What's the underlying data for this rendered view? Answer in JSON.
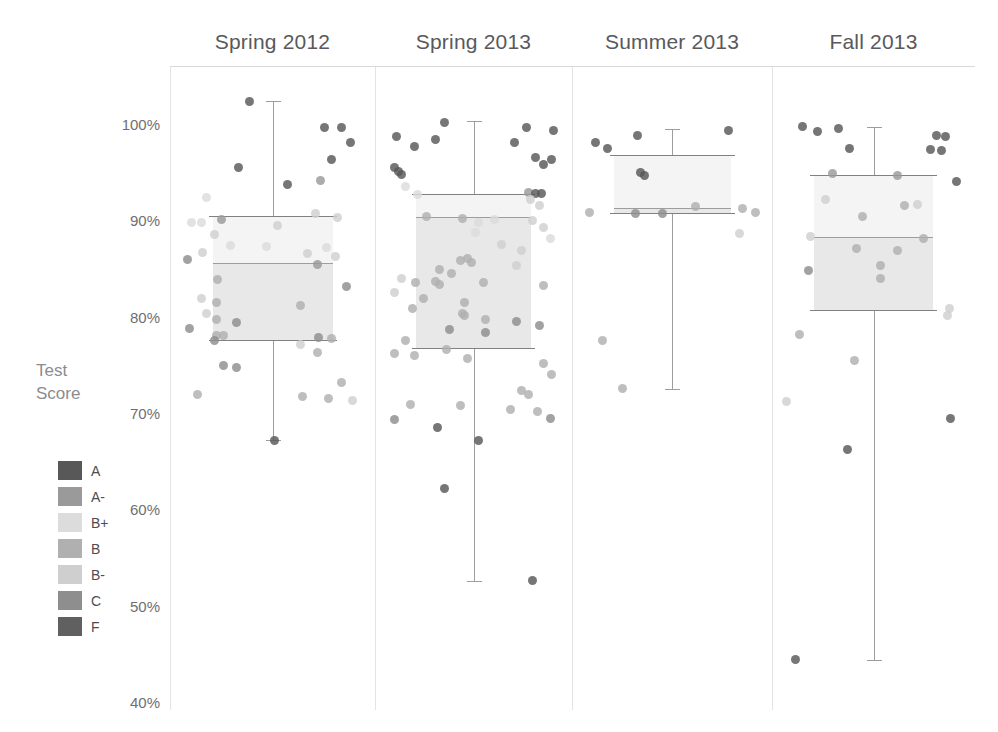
{
  "legend": {
    "title_line1": "Test",
    "title_line2": "Score",
    "items": [
      {
        "label": "A",
        "color": "#585858"
      },
      {
        "label": "A-",
        "color": "#9a9a9a"
      },
      {
        "label": "B+",
        "color": "#dcdcdc"
      },
      {
        "label": "B",
        "color": "#b0b0b0"
      },
      {
        "label": "B-",
        "color": "#cfcfcf"
      },
      {
        "label": "C",
        "color": "#8e8e8e"
      },
      {
        "label": "F",
        "color": "#606060"
      }
    ]
  },
  "chart_data": {
    "type": "box",
    "title": "",
    "xlabel": "",
    "ylabel": "Test Score",
    "ylim": [
      40,
      100
    ],
    "ytick_values": [
      100,
      90,
      80,
      70,
      60,
      50,
      40
    ],
    "ytick_labels": [
      "100%",
      "90%",
      "80%",
      "70%",
      "60%",
      "50%",
      "40%"
    ],
    "grid": false,
    "legend_position": "left",
    "categories": [
      "Spring 2012",
      "Spring 2013",
      "Summer 2013",
      "Fall 2013"
    ],
    "boxes": [
      {
        "category": "Spring 2012",
        "whisker_low": 67.3,
        "q1": 77.7,
        "median": 85.7,
        "q3": 90.6,
        "whisker_high": 102.5
      },
      {
        "category": "Spring 2013",
        "whisker_low": 52.7,
        "q1": 76.8,
        "median": 90.4,
        "q3": 92.8,
        "whisker_high": 100.4
      },
      {
        "category": "Summer 2013",
        "whisker_low": 72.6,
        "q1": 90.9,
        "median": 91.4,
        "q3": 96.9,
        "whisker_high": 99.6
      },
      {
        "category": "Fall 2013",
        "whisker_low": 44.5,
        "q1": 80.8,
        "median": 88.4,
        "q3": 94.8,
        "whisker_high": 99.8
      }
    ],
    "series": [
      {
        "name": "Spring 2012",
        "points": [
          {
            "v": 102.4,
            "j": 0.37,
            "g": "A"
          },
          {
            "v": 99.7,
            "j": 0.77,
            "g": "A"
          },
          {
            "v": 99.7,
            "j": 0.86,
            "g": "A"
          },
          {
            "v": 98.2,
            "j": 0.91,
            "g": "A"
          },
          {
            "v": 95.6,
            "j": 0.31,
            "g": "A"
          },
          {
            "v": 96.4,
            "j": 0.81,
            "g": "A"
          },
          {
            "v": 93.8,
            "j": 0.57,
            "g": "A"
          },
          {
            "v": 94.2,
            "j": 0.75,
            "g": "A-"
          },
          {
            "v": 92.5,
            "j": 0.14,
            "g": "B+"
          },
          {
            "v": 90.8,
            "j": 0.72,
            "g": "B-"
          },
          {
            "v": 90.4,
            "j": 0.84,
            "g": "B-"
          },
          {
            "v": 90.2,
            "j": 0.22,
            "g": "A-"
          },
          {
            "v": 89.9,
            "j": 0.06,
            "g": "B+"
          },
          {
            "v": 89.9,
            "j": 0.11,
            "g": "B+"
          },
          {
            "v": 89.6,
            "j": 0.52,
            "g": "B-"
          },
          {
            "v": 88.6,
            "j": 0.18,
            "g": "B-"
          },
          {
            "v": 87.5,
            "j": 0.27,
            "g": "B+"
          },
          {
            "v": 87.4,
            "j": 0.46,
            "g": "B+"
          },
          {
            "v": 87.3,
            "j": 0.78,
            "g": "B+"
          },
          {
            "v": 86.8,
            "j": 0.12,
            "g": "B-"
          },
          {
            "v": 86.7,
            "j": 0.68,
            "g": "B-"
          },
          {
            "v": 86.4,
            "j": 0.83,
            "g": "B-"
          },
          {
            "v": 86.0,
            "j": 0.04,
            "g": "C"
          },
          {
            "v": 85.5,
            "j": 0.73,
            "g": "A-"
          },
          {
            "v": 84.0,
            "j": 0.2,
            "g": "B"
          },
          {
            "v": 83.2,
            "j": 0.89,
            "g": "C"
          },
          {
            "v": 82.0,
            "j": 0.11,
            "g": "B-"
          },
          {
            "v": 81.6,
            "j": 0.19,
            "g": "B"
          },
          {
            "v": 81.3,
            "j": 0.64,
            "g": "B"
          },
          {
            "v": 80.4,
            "j": 0.14,
            "g": "B-"
          },
          {
            "v": 79.8,
            "j": 0.19,
            "g": "B"
          },
          {
            "v": 79.5,
            "j": 0.3,
            "g": "C"
          },
          {
            "v": 78.9,
            "j": 0.05,
            "g": "C"
          },
          {
            "v": 78.2,
            "j": 0.19,
            "g": "B"
          },
          {
            "v": 78.1,
            "j": 0.23,
            "g": "B"
          },
          {
            "v": 77.9,
            "j": 0.74,
            "g": "C"
          },
          {
            "v": 77.8,
            "j": 0.81,
            "g": "B"
          },
          {
            "v": 77.6,
            "j": 0.18,
            "g": "C"
          },
          {
            "v": 77.2,
            "j": 0.64,
            "g": "B-"
          },
          {
            "v": 76.4,
            "j": 0.73,
            "g": "B"
          },
          {
            "v": 75.0,
            "j": 0.23,
            "g": "C"
          },
          {
            "v": 74.8,
            "j": 0.3,
            "g": "C"
          },
          {
            "v": 73.3,
            "j": 0.86,
            "g": "B"
          },
          {
            "v": 72.0,
            "j": 0.09,
            "g": "B"
          },
          {
            "v": 71.8,
            "j": 0.65,
            "g": "B"
          },
          {
            "v": 71.6,
            "j": 0.79,
            "g": "B"
          },
          {
            "v": 71.4,
            "j": 0.92,
            "g": "B-"
          },
          {
            "v": 67.3,
            "j": 0.5,
            "g": "A"
          }
        ]
      },
      {
        "name": "Spring 2013",
        "points": [
          {
            "v": 100.3,
            "j": 0.33,
            "g": "A"
          },
          {
            "v": 99.7,
            "j": 0.79,
            "g": "A"
          },
          {
            "v": 99.4,
            "j": 0.94,
            "g": "A"
          },
          {
            "v": 98.8,
            "j": 0.06,
            "g": "A"
          },
          {
            "v": 98.5,
            "j": 0.28,
            "g": "A"
          },
          {
            "v": 98.2,
            "j": 0.72,
            "g": "A"
          },
          {
            "v": 97.8,
            "j": 0.16,
            "g": "A"
          },
          {
            "v": 96.6,
            "j": 0.84,
            "g": "A"
          },
          {
            "v": 96.4,
            "j": 0.93,
            "g": "A"
          },
          {
            "v": 95.9,
            "j": 0.88,
            "g": "A"
          },
          {
            "v": 95.6,
            "j": 0.05,
            "g": "A"
          },
          {
            "v": 95.2,
            "j": 0.07,
            "g": "A"
          },
          {
            "v": 94.9,
            "j": 0.09,
            "g": "A"
          },
          {
            "v": 93.6,
            "j": 0.11,
            "g": "B+"
          },
          {
            "v": 93.0,
            "j": 0.8,
            "g": "A-"
          },
          {
            "v": 92.9,
            "j": 0.84,
            "g": "A"
          },
          {
            "v": 92.9,
            "j": 0.87,
            "g": "A"
          },
          {
            "v": 92.8,
            "j": 0.18,
            "g": "B+"
          },
          {
            "v": 92.3,
            "j": 0.81,
            "g": "B-"
          },
          {
            "v": 91.6,
            "j": 0.86,
            "g": "B-"
          },
          {
            "v": 90.5,
            "j": 0.23,
            "g": "B"
          },
          {
            "v": 90.3,
            "j": 0.43,
            "g": "B"
          },
          {
            "v": 90.2,
            "j": 0.61,
            "g": "B+"
          },
          {
            "v": 90.1,
            "j": 0.82,
            "g": "B-"
          },
          {
            "v": 89.9,
            "j": 0.52,
            "g": "B+"
          },
          {
            "v": 89.4,
            "j": 0.88,
            "g": "B-"
          },
          {
            "v": 88.8,
            "j": 0.5,
            "g": "B+"
          },
          {
            "v": 88.2,
            "j": 0.92,
            "g": "B+"
          },
          {
            "v": 87.6,
            "j": 0.65,
            "g": "B-"
          },
          {
            "v": 87.0,
            "j": 0.76,
            "g": "B-"
          },
          {
            "v": 86.1,
            "j": 0.46,
            "g": "B"
          },
          {
            "v": 85.9,
            "j": 0.42,
            "g": "B"
          },
          {
            "v": 85.7,
            "j": 0.48,
            "g": "B"
          },
          {
            "v": 85.4,
            "j": 0.73,
            "g": "B-"
          },
          {
            "v": 85.0,
            "j": 0.3,
            "g": "B"
          },
          {
            "v": 84.6,
            "j": 0.37,
            "g": "B"
          },
          {
            "v": 84.1,
            "j": 0.09,
            "g": "B-"
          },
          {
            "v": 83.8,
            "j": 0.28,
            "g": "B"
          },
          {
            "v": 83.7,
            "j": 0.55,
            "g": "B"
          },
          {
            "v": 83.6,
            "j": 0.17,
            "g": "B"
          },
          {
            "v": 83.4,
            "j": 0.3,
            "g": "B"
          },
          {
            "v": 83.3,
            "j": 0.88,
            "g": "B"
          },
          {
            "v": 82.6,
            "j": 0.05,
            "g": "B-"
          },
          {
            "v": 82.0,
            "j": 0.21,
            "g": "B"
          },
          {
            "v": 81.6,
            "j": 0.44,
            "g": "B"
          },
          {
            "v": 81.0,
            "j": 0.15,
            "g": "B"
          },
          {
            "v": 80.4,
            "j": 0.43,
            "g": "B"
          },
          {
            "v": 80.2,
            "j": 0.44,
            "g": "B"
          },
          {
            "v": 79.8,
            "j": 0.56,
            "g": "B"
          },
          {
            "v": 79.6,
            "j": 0.73,
            "g": "C"
          },
          {
            "v": 79.2,
            "j": 0.86,
            "g": "C"
          },
          {
            "v": 78.8,
            "j": 0.36,
            "g": "C"
          },
          {
            "v": 78.5,
            "j": 0.56,
            "g": "C"
          },
          {
            "v": 77.6,
            "j": 0.11,
            "g": "B"
          },
          {
            "v": 76.7,
            "j": 0.34,
            "g": "B"
          },
          {
            "v": 76.3,
            "j": 0.05,
            "g": "B"
          },
          {
            "v": 76.1,
            "j": 0.16,
            "g": "B"
          },
          {
            "v": 75.8,
            "j": 0.46,
            "g": "B"
          },
          {
            "v": 75.2,
            "j": 0.88,
            "g": "B"
          },
          {
            "v": 74.1,
            "j": 0.93,
            "g": "B"
          },
          {
            "v": 72.4,
            "j": 0.76,
            "g": "B"
          },
          {
            "v": 72.0,
            "j": 0.8,
            "g": "B"
          },
          {
            "v": 71.0,
            "j": 0.14,
            "g": "B"
          },
          {
            "v": 70.9,
            "j": 0.42,
            "g": "B"
          },
          {
            "v": 70.5,
            "j": 0.7,
            "g": "B"
          },
          {
            "v": 70.3,
            "j": 0.85,
            "g": "B"
          },
          {
            "v": 69.4,
            "j": 0.05,
            "g": "C"
          },
          {
            "v": 69.5,
            "j": 0.92,
            "g": "C"
          },
          {
            "v": 68.6,
            "j": 0.29,
            "g": "A"
          },
          {
            "v": 67.2,
            "j": 0.52,
            "g": "A"
          },
          {
            "v": 62.3,
            "j": 0.33,
            "g": "A"
          },
          {
            "v": 52.7,
            "j": 0.82,
            "g": "A"
          }
        ]
      },
      {
        "name": "Summer 2013",
        "points": [
          {
            "v": 99.4,
            "j": 0.8,
            "g": "A"
          },
          {
            "v": 98.9,
            "j": 0.3,
            "g": "A"
          },
          {
            "v": 98.2,
            "j": 0.07,
            "g": "A"
          },
          {
            "v": 97.6,
            "j": 0.14,
            "g": "A"
          },
          {
            "v": 95.1,
            "j": 0.32,
            "g": "A"
          },
          {
            "v": 94.8,
            "j": 0.34,
            "g": "A"
          },
          {
            "v": 91.5,
            "j": 0.62,
            "g": "B"
          },
          {
            "v": 91.3,
            "j": 0.88,
            "g": "B"
          },
          {
            "v": 90.9,
            "j": 0.04,
            "g": "B"
          },
          {
            "v": 90.8,
            "j": 0.29,
            "g": "C"
          },
          {
            "v": 90.8,
            "j": 0.44,
            "g": "C"
          },
          {
            "v": 90.9,
            "j": 0.95,
            "g": "B"
          },
          {
            "v": 88.7,
            "j": 0.86,
            "g": "B-"
          },
          {
            "v": 77.6,
            "j": 0.11,
            "g": "B"
          },
          {
            "v": 72.6,
            "j": 0.22,
            "g": "B"
          }
        ]
      },
      {
        "name": "Fall 2013",
        "points": [
          {
            "v": 99.8,
            "j": 0.11,
            "g": "A"
          },
          {
            "v": 99.3,
            "j": 0.19,
            "g": "A"
          },
          {
            "v": 99.6,
            "j": 0.3,
            "g": "A"
          },
          {
            "v": 98.9,
            "j": 0.83,
            "g": "A"
          },
          {
            "v": 98.8,
            "j": 0.88,
            "g": "A"
          },
          {
            "v": 97.6,
            "j": 0.36,
            "g": "A"
          },
          {
            "v": 97.5,
            "j": 0.8,
            "g": "A"
          },
          {
            "v": 97.4,
            "j": 0.86,
            "g": "A"
          },
          {
            "v": 95.0,
            "j": 0.27,
            "g": "A-"
          },
          {
            "v": 94.8,
            "j": 0.62,
            "g": "A-"
          },
          {
            "v": 94.1,
            "j": 0.94,
            "g": "A"
          },
          {
            "v": 92.3,
            "j": 0.23,
            "g": "B-"
          },
          {
            "v": 91.6,
            "j": 0.66,
            "g": "B"
          },
          {
            "v": 91.7,
            "j": 0.73,
            "g": "B-"
          },
          {
            "v": 90.5,
            "j": 0.43,
            "g": "B"
          },
          {
            "v": 88.4,
            "j": 0.15,
            "g": "B-"
          },
          {
            "v": 88.2,
            "j": 0.76,
            "g": "B"
          },
          {
            "v": 87.2,
            "j": 0.4,
            "g": "B"
          },
          {
            "v": 87.0,
            "j": 0.62,
            "g": "B"
          },
          {
            "v": 85.4,
            "j": 0.53,
            "g": "B"
          },
          {
            "v": 84.9,
            "j": 0.14,
            "g": "C"
          },
          {
            "v": 84.1,
            "j": 0.53,
            "g": "B"
          },
          {
            "v": 81.0,
            "j": 0.9,
            "g": "B-"
          },
          {
            "v": 80.2,
            "j": 0.89,
            "g": "B-"
          },
          {
            "v": 78.3,
            "j": 0.09,
            "g": "B"
          },
          {
            "v": 75.6,
            "j": 0.39,
            "g": "B"
          },
          {
            "v": 71.3,
            "j": 0.02,
            "g": "B-"
          },
          {
            "v": 69.5,
            "j": 0.91,
            "g": "A"
          },
          {
            "v": 66.3,
            "j": 0.35,
            "g": "A"
          },
          {
            "v": 44.5,
            "j": 0.07,
            "g": "A"
          }
        ]
      }
    ]
  },
  "axis": {
    "top_rule_visible": true
  }
}
